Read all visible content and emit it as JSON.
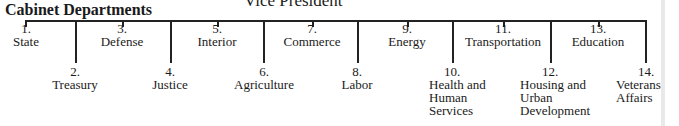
{
  "header": {
    "vice_president": "Vice President",
    "section_title": "Cabinet Departments"
  },
  "departments": [
    {
      "num": "1.",
      "name": "State",
      "row": "upper"
    },
    {
      "num": "2.",
      "name": "Treasury",
      "row": "lower"
    },
    {
      "num": "3.",
      "name": "Defense",
      "row": "upper"
    },
    {
      "num": "4.",
      "name": "Justice",
      "row": "lower"
    },
    {
      "num": "5.",
      "name": "Interior",
      "row": "upper"
    },
    {
      "num": "6.",
      "name": "Agriculture",
      "row": "lower"
    },
    {
      "num": "7.",
      "name": "Commerce",
      "row": "upper"
    },
    {
      "num": "8.",
      "name": "Labor",
      "row": "lower"
    },
    {
      "num": "9.",
      "name": "Energy",
      "row": "upper"
    },
    {
      "num": "10.",
      "name_lines": [
        "Health and",
        "Human",
        "Services"
      ],
      "row": "lower"
    },
    {
      "num": "11.",
      "name": "Transportation",
      "row": "upper"
    },
    {
      "num": "12.",
      "name_lines": [
        "Housing and",
        "Urban",
        "Development"
      ],
      "row": "lower"
    },
    {
      "num": "13.",
      "name": "Education",
      "row": "upper"
    },
    {
      "num": "14.",
      "name_lines": [
        "Veterans'",
        "Affairs"
      ],
      "row": "lower"
    }
  ]
}
